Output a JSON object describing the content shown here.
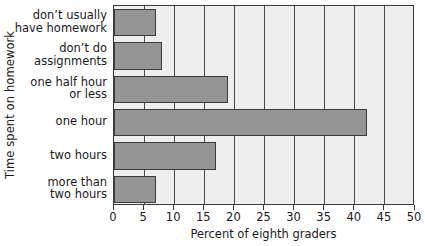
{
  "chart_data": {
    "type": "bar",
    "orientation": "horizontal",
    "title": "",
    "xlabel": "Percent of eighth graders",
    "ylabel": "Time spent on homework",
    "categories": [
      "don't usually have homework",
      "don't do assignments",
      "one half hour or less",
      "one hour",
      "two hours",
      "more than two hours"
    ],
    "category_lines": [
      [
        "don’t usually",
        "have homework"
      ],
      [
        "don’t do",
        "assignments"
      ],
      [
        "one half hour",
        "or less"
      ],
      [
        "one hour"
      ],
      [
        "two hours"
      ],
      [
        "more than",
        "two hours"
      ]
    ],
    "values": [
      7,
      8,
      19,
      42,
      17,
      7
    ],
    "xlim": [
      0,
      50
    ],
    "xticks": [
      0,
      5,
      10,
      15,
      20,
      25,
      30,
      35,
      40,
      45,
      50
    ],
    "xtick_labels": [
      "0",
      "5",
      "10",
      "15",
      "20",
      "25",
      "30",
      "35",
      "40",
      "45",
      "50"
    ],
    "grid": "vertical",
    "legend": null,
    "colors": {
      "bar_fill": "#959595",
      "bar_edge": "#3c3c3c",
      "plot_background": "#eeeeee",
      "gridline": "#4a4a4a",
      "axis": "#3a3a3a",
      "text": "#1a1a1a",
      "figure_background": "#ffffff"
    }
  }
}
